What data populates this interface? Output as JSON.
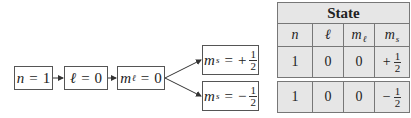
{
  "flow": {
    "n": {
      "var": "n",
      "eq": "=",
      "val": "1"
    },
    "l": {
      "var": "ℓ",
      "eq": "=",
      "val": "0"
    },
    "ml": {
      "var": "m",
      "sub": "ℓ",
      "eq": "=",
      "val": "0"
    },
    "ms_plus": {
      "var": "m",
      "sub": "s",
      "eq": "=",
      "sign": "+",
      "num": "1",
      "den": "2"
    },
    "ms_minus": {
      "var": "m",
      "sub": "s",
      "eq": "=",
      "sign": "−",
      "num": "1",
      "den": "2"
    }
  },
  "table": {
    "title": "State",
    "headers": {
      "n": "n",
      "l": "ℓ",
      "ml_var": "m",
      "ml_sub": "ℓ",
      "ms_var": "m",
      "ms_sub": "s"
    },
    "rows": [
      {
        "n": "1",
        "l": "0",
        "ml": "0",
        "ms_sign": "+",
        "ms_num": "1",
        "ms_den": "2"
      },
      {
        "n": "1",
        "l": "0",
        "ml": "0",
        "ms_sign": "−",
        "ms_num": "1",
        "ms_den": "2"
      }
    ]
  },
  "colors": {
    "table_bg": "#e6e6e6",
    "border": "#555555"
  }
}
